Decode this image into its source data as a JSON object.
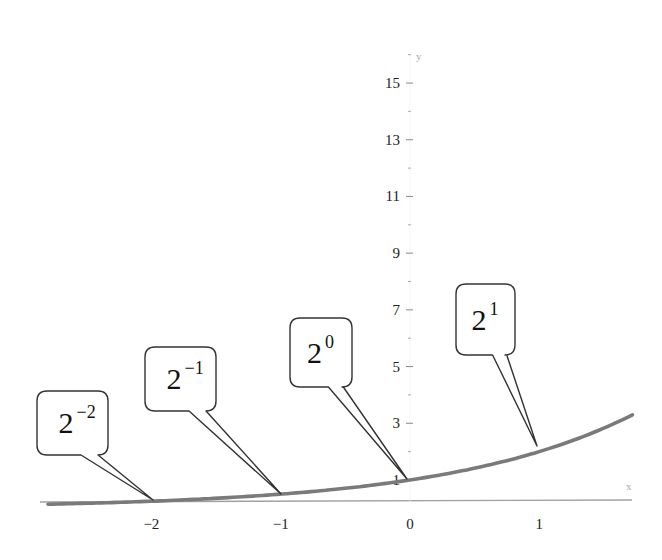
{
  "chart_data": {
    "type": "line",
    "title": "",
    "function": "y = 2^x",
    "xlabel": "x",
    "ylabel": "y",
    "xlim": [
      -2.8,
      1.72
    ],
    "ylim": [
      0,
      16
    ],
    "grid": false,
    "x_ticks": [
      -2,
      -1,
      0,
      1
    ],
    "x_tick_labels": [
      "−2",
      "−1",
      "0",
      "1"
    ],
    "y_ticks": [
      1,
      3,
      5,
      7,
      9,
      11,
      13,
      15
    ],
    "y_tick_labels": [
      "1",
      "3",
      "5",
      "7",
      "9",
      "11",
      "13",
      "15"
    ],
    "y_minor_ticks": [
      2,
      4,
      6,
      8,
      10,
      12,
      14,
      16
    ],
    "series": [
      {
        "name": "2^x",
        "x": [
          -2.8,
          -2,
          -1.5,
          -1,
          -0.5,
          0,
          0.5,
          1,
          1.5,
          1.72
        ],
        "values": [
          0.144,
          0.25,
          0.354,
          0.5,
          0.707,
          1,
          1.414,
          2,
          2.828,
          3.29
        ],
        "color": "#7a7a7a"
      }
    ],
    "annotations": [
      {
        "base": "2",
        "exponent": "−2",
        "x": -2,
        "y": 0.25
      },
      {
        "base": "2",
        "exponent": "−1",
        "x": -1,
        "y": 0.5
      },
      {
        "base": "2",
        "exponent": "0",
        "x": 0,
        "y": 1
      },
      {
        "base": "2",
        "exponent": "1",
        "x": 1,
        "y": 2
      }
    ]
  },
  "colors": {
    "curve": "#7a7a7a",
    "axis": "#9a9a9a",
    "callout_border": "#333333",
    "text": "#222222"
  }
}
